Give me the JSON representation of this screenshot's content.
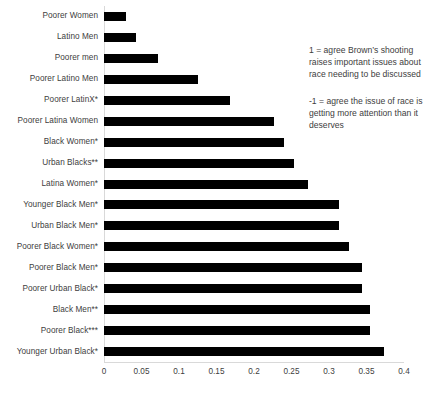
{
  "chart_data": {
    "type": "bar",
    "orientation": "horizontal",
    "title": "",
    "xlabel": "",
    "ylabel": "",
    "xlim": [
      0,
      0.4
    ],
    "xticks": [
      "0",
      "0.05",
      "0.1",
      "0.15",
      "0.2",
      "0.25",
      "0.3",
      "0.35",
      "0.4"
    ],
    "xtick_values": [
      0,
      0.05,
      0.1,
      0.15,
      0.2,
      0.25,
      0.3,
      0.35,
      0.4
    ],
    "grid": false,
    "legend": "none",
    "bar_color": "#000000",
    "categories": [
      "Poorer Women",
      "Latino Men",
      "Poorer men",
      "Poorer Latino Men",
      "Poorer LatinX*",
      "Poorer Latina Women",
      "Black Women*",
      "Urban Blacks**",
      "Latina Women*",
      "Younger Black Men*",
      "Urban Black Men*",
      "Poorer Black Women*",
      "Poorer Black Men*",
      "Poorer Urban Black*",
      "Black Men**",
      "Poorer Black***",
      "Younger Urban Black*"
    ],
    "values": [
      0.029,
      0.043,
      0.072,
      0.125,
      0.168,
      0.227,
      0.24,
      0.253,
      0.272,
      0.313,
      0.313,
      0.326,
      0.344,
      0.344,
      0.355,
      0.355,
      0.373
    ],
    "annotations": [
      "1 = agree Brown’s shooting raises important issues about race needing to be discussed",
      "-1 = agree the issue of race is getting more attention than it deserves"
    ]
  }
}
